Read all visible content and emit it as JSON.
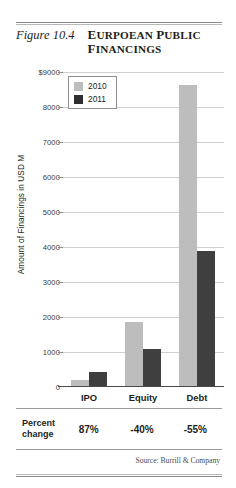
{
  "figure": {
    "number": "Figure 10.4",
    "title_line1": "Eurpoean Public",
    "title_line2": "Financings",
    "source": "Source: Burrill & Company"
  },
  "chart_data": {
    "type": "bar",
    "title": "Eurpoean Public Financings",
    "categories": [
      "IPO",
      "Equity",
      "Debt"
    ],
    "series": [
      {
        "name": "2010",
        "color": "#bdbdbd",
        "values": [
          200,
          1800,
          8300
        ]
      },
      {
        "name": "2011",
        "color": "#3f3f3f",
        "values": [
          400,
          1050,
          3750
        ]
      }
    ],
    "xlabel": "",
    "ylabel": "Amount of Financings in USD M",
    "ylim": [
      0,
      9000
    ],
    "ytick_step": 1000,
    "ytick_labels": [
      "$9000",
      "8000",
      "7000",
      "6000",
      "5000",
      "4000",
      "3000",
      "2000",
      "1000",
      "0"
    ],
    "ytick_values": [
      9000,
      8000,
      7000,
      6000,
      5000,
      4000,
      3000,
      2000,
      1000,
      0
    ],
    "grid": true,
    "legend_position": "top-left-inside",
    "annotations": {
      "percent_change_label": "Percent change",
      "percent_change": [
        "87%",
        "-40%",
        "-55%"
      ]
    }
  },
  "legend": {
    "items": [
      {
        "label": "2010"
      },
      {
        "label": "2011"
      }
    ]
  },
  "pct_table": {
    "head_line1": "Percent",
    "head_line2": "change",
    "values": [
      "87%",
      "-40%",
      "-55%"
    ]
  },
  "yticks": {
    "t9000": "$9000",
    "t8000": "8000",
    "t7000": "7000",
    "t6000": "6000",
    "t5000": "5000",
    "t4000": "4000",
    "t3000": "3000",
    "t2000": "2000",
    "t1000": "1000",
    "t0": "0"
  },
  "axis": {
    "ylabel": "Amount of Financings in USD M"
  },
  "categories": {
    "c0": "IPO",
    "c1": "Equity",
    "c2": "Debt"
  }
}
